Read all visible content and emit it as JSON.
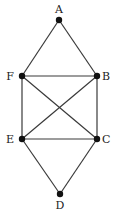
{
  "diagram": {
    "type": "graph",
    "nodes": [
      {
        "id": "A",
        "label": "A",
        "x": 59,
        "y": 20,
        "lx": 59,
        "ly": 13,
        "anchor": "middle"
      },
      {
        "id": "F",
        "label": "F",
        "x": 22,
        "y": 76,
        "lx": 14,
        "ly": 80,
        "anchor": "end"
      },
      {
        "id": "B",
        "label": "B",
        "x": 97,
        "y": 76,
        "lx": 102,
        "ly": 80,
        "anchor": "start"
      },
      {
        "id": "E",
        "label": "E",
        "x": 22,
        "y": 139,
        "lx": 14,
        "ly": 143,
        "anchor": "end"
      },
      {
        "id": "C",
        "label": "C",
        "x": 97,
        "y": 139,
        "lx": 102,
        "ly": 143,
        "anchor": "start"
      },
      {
        "id": "D",
        "label": "D",
        "x": 60,
        "y": 194,
        "lx": 60,
        "ly": 209,
        "anchor": "middle"
      }
    ],
    "edges": [
      [
        "A",
        "F"
      ],
      [
        "A",
        "B"
      ],
      [
        "F",
        "B"
      ],
      [
        "F",
        "E"
      ],
      [
        "F",
        "C"
      ],
      [
        "B",
        "E"
      ],
      [
        "B",
        "C"
      ],
      [
        "E",
        "C"
      ],
      [
        "E",
        "D"
      ],
      [
        "C",
        "D"
      ]
    ]
  }
}
